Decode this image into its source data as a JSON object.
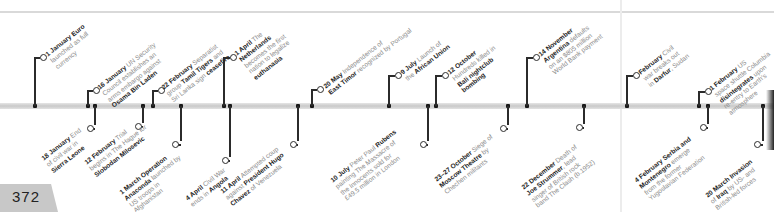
{
  "page": {
    "number": "372"
  },
  "timeline": {
    "above": [
      {
        "date": "1 January",
        "text": [
          {
            "t": "Euro",
            "b": true
          },
          {
            "t": " launched as full currency"
          }
        ]
      },
      {
        "date": "16 January",
        "text": [
          {
            "t": "UN Security Council establishes an arms embargo against "
          },
          {
            "t": "Osama Bin Laden",
            "b": true
          }
        ]
      },
      {
        "date": "22 February",
        "text": [
          {
            "t": "Separatist group "
          },
          {
            "t": "Tamil Tigers",
            "b": true
          },
          {
            "t": " and Sri Lanka sign "
          },
          {
            "t": "ceasefire",
            "b": true
          }
        ]
      },
      {
        "date": "1 April",
        "text": [
          {
            "t": "The "
          },
          {
            "t": "Netherlands",
            "b": true
          },
          {
            "t": " becomes the first nation to legalize "
          },
          {
            "t": "euthanasia",
            "b": true
          }
        ]
      },
      {
        "date": "20 May",
        "text": [
          {
            "t": "Independence of "
          },
          {
            "t": "East Timor",
            "b": true
          },
          {
            "t": " recognized by Portugal"
          }
        ]
      },
      {
        "date": "9 July",
        "text": [
          {
            "t": "Launch of the "
          },
          {
            "t": "African Union",
            "b": true
          }
        ]
      },
      {
        "date": "12 October",
        "text": [
          {
            "t": "Hundreds killed in "
          },
          {
            "t": "Bali nightclub bombing",
            "b": true
          }
        ]
      },
      {
        "date": "14 November",
        "text": [
          {
            "t": "Argentina",
            "b": true
          },
          {
            "t": " defaults on an $805 million World Bank payment"
          }
        ]
      },
      {
        "date": "February",
        "text": [
          {
            "t": "Civil war breaks out in "
          },
          {
            "t": "Darfur",
            "b": true
          },
          {
            "t": ", Sudan"
          }
        ]
      },
      {
        "date": "1 February",
        "text": [
          {
            "t": "US space shuttle Columbia "
          },
          {
            "t": "disintegrates",
            "b": true
          },
          {
            "t": " upon re-entry to Earth's atmosphere"
          }
        ]
      }
    ],
    "below": [
      {
        "date": "18 January",
        "text": [
          {
            "t": "End of civil war in "
          },
          {
            "t": "Sierra Leone",
            "b": true
          }
        ]
      },
      {
        "date": "12 February",
        "text": [
          {
            "t": "Trial begins in The Hague for "
          },
          {
            "t": "Slobodan Milosevic",
            "b": true
          }
        ]
      },
      {
        "date": "1 March",
        "text": [
          {
            "t": "Operation Anaconda",
            "b": true
          },
          {
            "t": " launched by US troops in Afghanistan"
          }
        ]
      },
      {
        "date": "4 April",
        "text": [
          {
            "t": "Civil War ends in "
          },
          {
            "t": "Angola",
            "b": true
          }
        ]
      },
      {
        "date": "11 April",
        "text": [
          {
            "t": "Attempted coup against "
          },
          {
            "t": "President Hugo Chavez",
            "b": true
          },
          {
            "t": " of Venezuela"
          }
        ]
      },
      {
        "date": "10 July",
        "text": [
          {
            "t": "Peter Paul "
          },
          {
            "t": "Rubens",
            "b": true
          },
          {
            "t": " painting The Massacre of the Innocents sold for £49.5 million in London"
          }
        ]
      },
      {
        "date": "23–27 October",
        "text": [
          {
            "t": "Siege of "
          },
          {
            "t": "Moscow Theatre",
            "b": true
          },
          {
            "t": " by Chechen militants"
          }
        ]
      },
      {
        "date": "22 December",
        "text": [
          {
            "t": "Death of "
          },
          {
            "t": "Joe Strummer",
            "b": true
          },
          {
            "t": ", lead singer of British rock band The Clash (b.1952)"
          }
        ]
      },
      {
        "date": "4 February",
        "text": [
          {
            "t": "Serbia and Montenegro",
            "b": true
          },
          {
            "t": " emerge from the former Yugoslavian Federation"
          }
        ]
      },
      {
        "date": "20 March",
        "text": [
          {
            "t": "Invasion of Iraq",
            "b": true
          },
          {
            "t": " by US- and British-led forces"
          }
        ]
      }
    ]
  },
  "labels_rendered": {
    "a0": [
      "1 January Euro",
      "launched as full",
      "currency"
    ],
    "a1": [
      "16 January UN Security",
      "Council establishes an",
      "arms embargo against",
      "Osama Bin Laden"
    ],
    "a2": [
      "22 February Separatist",
      "group Tamil Tigers and",
      "Sri Lanka sign ceasefire"
    ],
    "a3": [
      "1 April The",
      "Netherlands",
      "becomes the first",
      "nation to legalize",
      "euthanasia"
    ],
    "a4": [
      "20 May Independence of",
      "East Timor recognized by Portugal"
    ],
    "a5": [
      "9 July Launch of",
      "the African Union"
    ],
    "a6": [
      "12 October",
      "Hundreds killed in",
      "Bali nightclub",
      "bombing"
    ],
    "a7": [
      "14 November",
      "Argentina defaults",
      "on an $805 million",
      "World Bank payment"
    ],
    "a8": [
      "February Civil",
      "war breaks out",
      "in Darfur, Sudan"
    ],
    "a9": [
      "1 February US",
      "space shuttle Columbia",
      "disintegrates upon",
      "re-entry to Earth's",
      "atmosphere"
    ],
    "b0": [
      "18 January End",
      "of civil war in",
      "Sierra Leone"
    ],
    "b1": [
      "12 February Trial",
      "begins in The Hague for",
      "Slobodan Milosevic"
    ],
    "b2": [
      "1 March Operation",
      "Anaconda launched by",
      "US troops in",
      "Afghanistan"
    ],
    "b3": [
      "4 April Civil War",
      "ends in Angola"
    ],
    "b4": [
      "11 April Attempted coup",
      "against President Hugo",
      "Chavez of Venezuela"
    ],
    "b5": [
      "10 July Peter Paul Rubens",
      "painting The Massacre of",
      "the Innocents sold for",
      "£49.5 million in London"
    ],
    "b6": [
      "23–27 October Siege of",
      "Moscow Theatre by",
      "Chechen militants"
    ],
    "b7": [
      "22 December Death of",
      "Joe Strummer, lead",
      "singer of British rock",
      "band The Clash (b.1952)"
    ],
    "b8": [
      "4 February Serbia and",
      "Montenegro emerge",
      "from the former",
      "Yugoslavian Federation"
    ],
    "b9": [
      "20 March Invasion",
      "of Iraq by US- and",
      "British-led forces"
    ]
  },
  "colors": {
    "bar": "#cfcfcf",
    "stem": "#2b2b2b",
    "bold_text": "#222222",
    "light_text": "#8c8c8c",
    "page_tab": "#c8c8c8"
  }
}
